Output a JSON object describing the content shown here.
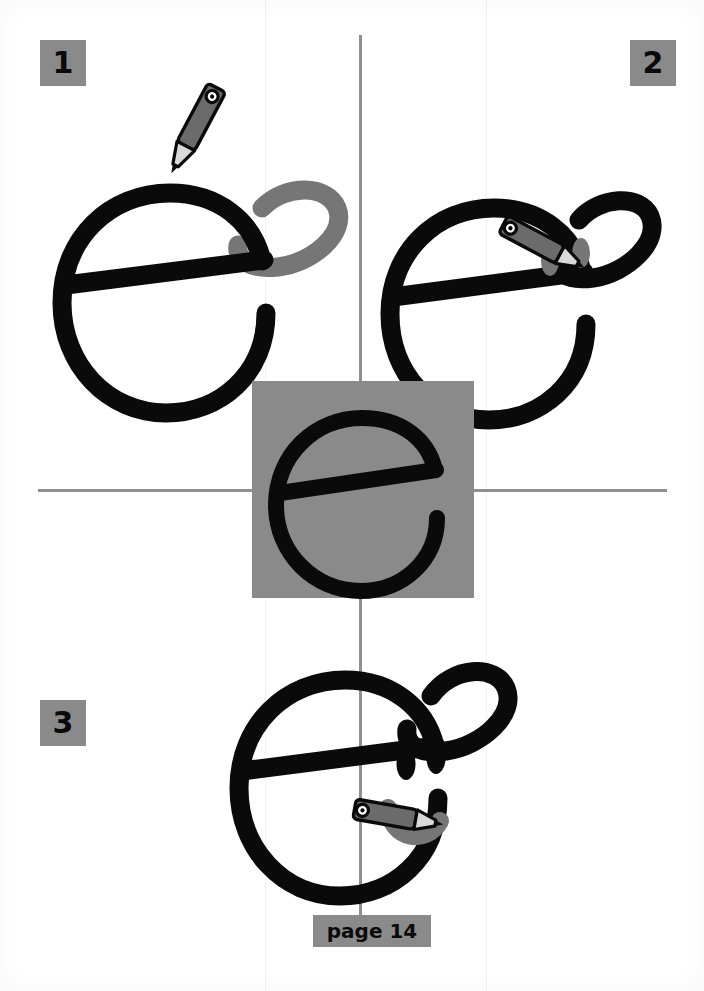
{
  "page": {
    "width": 704,
    "height": 991,
    "background_color": "#ffffff",
    "footer_label": "page 14"
  },
  "colors": {
    "ink_black": "#0a0a0a",
    "accent_gray": "#8a8a8a",
    "divider_gray": "#8f8f8f",
    "pencil_body": "#6b6b6b",
    "pencil_tip": "#d9d9d9",
    "new_stroke_gray": "#767676"
  },
  "dividers": {
    "vertical_label": "vertical divider line",
    "horizontal_label": "horizontal divider line"
  },
  "center": {
    "caption": "base letter e reference",
    "glyph": "e"
  },
  "steps": [
    {
      "number": "1",
      "badge_label": "1",
      "instruction_visual": "Draw a looping cap over the top right of the letter e",
      "new_stroke_name": "cap-loop",
      "new_stroke_color": "#767676",
      "pencil": "drawing the cap loop"
    },
    {
      "number": "2",
      "badge_label": "2",
      "instruction_visual": "Add two eyes below the crossbar of the e",
      "new_stroke_name": "eyes",
      "new_stroke_color": "#767676",
      "pencil": "drawing the second eye"
    },
    {
      "number": "3",
      "badge_label": "3",
      "instruction_visual": "Add a curved smiling mouth under the eyes",
      "new_stroke_name": "smile",
      "new_stroke_color": "#767676",
      "pencil": "drawing the smile"
    }
  ],
  "icons": {
    "pencil": "pencil-icon",
    "letter_e": "letter-e-icon",
    "eye": "eye-icon",
    "smile": "smile-icon",
    "cap_loop": "cap-loop-icon"
  }
}
